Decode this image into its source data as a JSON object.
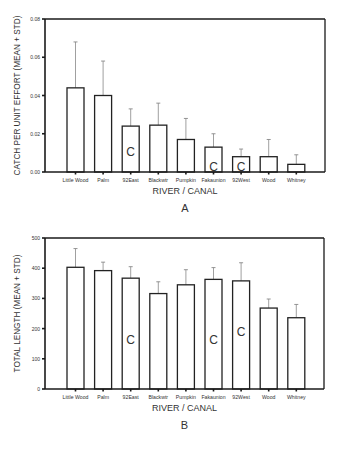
{
  "chart_data": [
    {
      "type": "bar",
      "panel_label": "A",
      "title": "",
      "xlabel": "RIVER / CANAL",
      "ylabel": "CATCH PER UNIT EFFORT (MEAN + STD)",
      "ylim": [
        0,
        0.08
      ],
      "yticks": [
        "0.00",
        "0.02",
        "0.04",
        "0.06",
        "0.08"
      ],
      "ytick_values": [
        0,
        0.02,
        0.04,
        0.06,
        0.08
      ],
      "grid": false,
      "legend": null,
      "categories": [
        "Little Wood",
        "Palm",
        "92East",
        "Blackwtr",
        "Pumpkin",
        "Fakaunion",
        "92West",
        "Wood",
        "Whitney"
      ],
      "values": [
        0.044,
        0.04,
        0.024,
        0.0245,
        0.017,
        0.013,
        0.008,
        0.008,
        0.004
      ],
      "error_upper": [
        0.068,
        0.058,
        0.033,
        0.036,
        0.028,
        0.02,
        0.012,
        0.017,
        0.009
      ],
      "annotations": [
        "",
        "",
        "C",
        "",
        "",
        "C",
        "C",
        "",
        ""
      ]
    },
    {
      "type": "bar",
      "panel_label": "B",
      "title": "",
      "xlabel": "RIVER / CANAL",
      "ylabel": "TOTAL LENGTH (MEAN + STD)",
      "ylim": [
        0,
        500
      ],
      "yticks": [
        "0",
        "100",
        "200",
        "300",
        "400",
        "500"
      ],
      "ytick_values": [
        0,
        100,
        200,
        300,
        400,
        500
      ],
      "grid": false,
      "legend": null,
      "categories": [
        "Little Wood",
        "Palm",
        "92East",
        "Blackwtr",
        "Pumpkin",
        "Fakaunion",
        "92West",
        "Wood",
        "Whitney"
      ],
      "values": [
        403,
        392,
        367,
        316,
        345,
        363,
        358,
        268,
        236
      ],
      "error_upper": [
        465,
        420,
        405,
        355,
        395,
        402,
        418,
        298,
        280
      ],
      "annotations": [
        "",
        "",
        "C",
        "",
        "",
        "C",
        "C",
        "",
        ""
      ],
      "annotation_heights": [
        0,
        0,
        150,
        0,
        0,
        150,
        175,
        0,
        0
      ]
    }
  ],
  "colors": {
    "axis": "#1a1a1a",
    "bar_fill": "#ffffff",
    "bar_stroke": "#222222",
    "error": "#888888",
    "text": "#333333"
  }
}
